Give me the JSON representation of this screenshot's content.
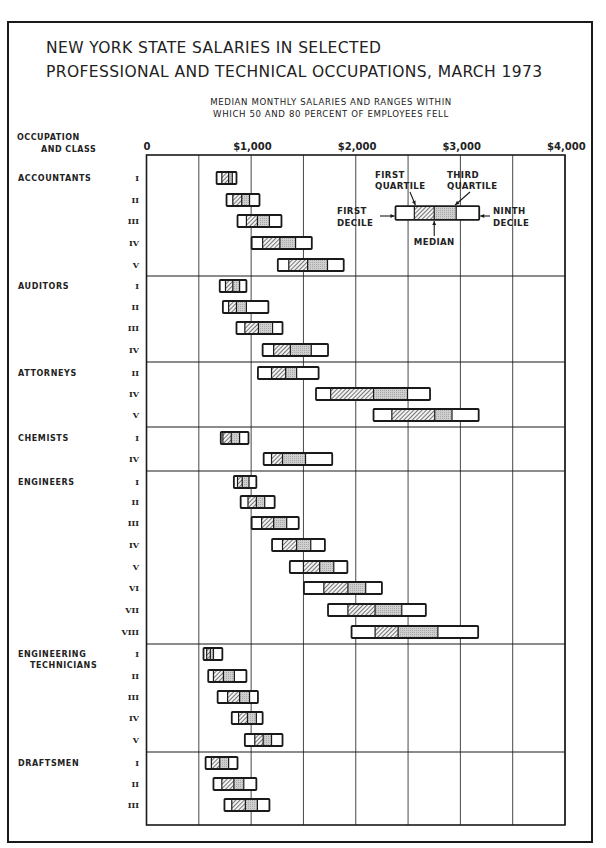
{
  "title": {
    "line1": "NEW YORK STATE SALARIES IN SELECTED",
    "line2": "PROFESSIONAL AND TECHNICAL OCCUPATIONS, MARCH 1973"
  },
  "subtitle": {
    "line1": "MEDIAN MONTHLY SALARIES AND RANGES WITHIN",
    "line2": "WHICH 50 AND 80 PERCENT OF EMPLOYEES FELL"
  },
  "axis_header": {
    "line1": "OCCUPATION",
    "line2": "AND CLASS"
  },
  "legend": {
    "first_quartile": [
      "FIRST",
      "QUARTILE"
    ],
    "third_quartile": [
      "THIRD",
      "QUARTILE"
    ],
    "first_decile": [
      "FIRST",
      "DECILE"
    ],
    "ninth_decile": [
      "NINTH",
      "DECILE"
    ],
    "median": "MEDIAN"
  },
  "chart_data": {
    "type": "box-range",
    "title": "NEW YORK STATE SALARIES IN SELECTED PROFESSIONAL AND TECHNICAL OCCUPATIONS, MARCH 1973",
    "subtitle": "MEDIAN MONTHLY SALARIES AND RANGES WITHIN WHICH 50 AND 80 PERCENT OF EMPLOYEES FELL",
    "xlabel": "Monthly salary ($)",
    "ylabel": "OCCUPATION AND CLASS",
    "xlim": [
      0,
      4000
    ],
    "x_ticks": [
      {
        "value": 0,
        "label": "0"
      },
      {
        "value": 1000,
        "label": "$1,000"
      },
      {
        "value": 2000,
        "label": "$2,000"
      },
      {
        "value": 3000,
        "label": "$3,000"
      },
      {
        "value": 4000,
        "label": "$4,000"
      }
    ],
    "gridlines_every": 500,
    "series_keys": [
      "first_decile",
      "first_quartile",
      "median",
      "third_quartile",
      "ninth_decile"
    ],
    "groups": [
      {
        "occupation": "ACCOUNTANTS",
        "rows": [
          {
            "class": "I",
            "d1": 670,
            "q1": 720,
            "median": 785,
            "q3": 820,
            "d9": 860
          },
          {
            "class": "II",
            "d1": 765,
            "q1": 825,
            "median": 910,
            "q3": 985,
            "d9": 1080
          },
          {
            "class": "III",
            "d1": 870,
            "q1": 955,
            "median": 1060,
            "q3": 1175,
            "d9": 1290
          },
          {
            "class": "IV",
            "d1": 1005,
            "q1": 1110,
            "median": 1275,
            "q3": 1425,
            "d9": 1580
          },
          {
            "class": "V",
            "d1": 1255,
            "q1": 1360,
            "median": 1540,
            "q3": 1730,
            "d9": 1885
          }
        ]
      },
      {
        "occupation": "AUDITORS",
        "rows": [
          {
            "class": "I",
            "d1": 700,
            "q1": 755,
            "median": 825,
            "q3": 890,
            "d9": 955
          },
          {
            "class": "II",
            "d1": 730,
            "q1": 785,
            "median": 860,
            "q3": 955,
            "d9": 1165
          },
          {
            "class": "III",
            "d1": 860,
            "q1": 940,
            "median": 1070,
            "q3": 1205,
            "d9": 1300
          },
          {
            "class": "IV",
            "d1": 1110,
            "q1": 1215,
            "median": 1375,
            "q3": 1575,
            "d9": 1735
          }
        ]
      },
      {
        "occupation": "ATTORNEYS",
        "rows": [
          {
            "class": "II",
            "d1": 1065,
            "q1": 1195,
            "median": 1330,
            "q3": 1435,
            "d9": 1645
          },
          {
            "class": "IV",
            "d1": 1620,
            "q1": 1760,
            "median": 2170,
            "q3": 2495,
            "d9": 2710
          },
          {
            "class": "V",
            "d1": 2170,
            "q1": 2345,
            "median": 2755,
            "q3": 2920,
            "d9": 3175
          }
        ]
      },
      {
        "occupation": "CHEMISTS",
        "rows": [
          {
            "class": "I",
            "d1": 710,
            "q1": 730,
            "median": 810,
            "q3": 890,
            "d9": 975
          },
          {
            "class": "IV",
            "d1": 1120,
            "q1": 1195,
            "median": 1300,
            "q3": 1520,
            "d9": 1775
          }
        ]
      },
      {
        "occupation": "ENGINEERS",
        "rows": [
          {
            "class": "I",
            "d1": 835,
            "q1": 870,
            "median": 915,
            "q3": 980,
            "d9": 1050
          },
          {
            "class": "II",
            "d1": 900,
            "q1": 970,
            "median": 1050,
            "q3": 1130,
            "d9": 1225
          },
          {
            "class": "III",
            "d1": 1005,
            "q1": 1100,
            "median": 1215,
            "q3": 1340,
            "d9": 1455
          },
          {
            "class": "IV",
            "d1": 1200,
            "q1": 1300,
            "median": 1435,
            "q3": 1570,
            "d9": 1705
          },
          {
            "class": "V",
            "d1": 1370,
            "q1": 1500,
            "median": 1655,
            "q3": 1790,
            "d9": 1920
          },
          {
            "class": "VI",
            "d1": 1505,
            "q1": 1695,
            "median": 1925,
            "q3": 2095,
            "d9": 2250
          },
          {
            "class": "VII",
            "d1": 1735,
            "q1": 1925,
            "median": 2185,
            "q3": 2440,
            "d9": 2670
          },
          {
            "class": "VIII",
            "d1": 1960,
            "q1": 2185,
            "median": 2405,
            "q3": 2785,
            "d9": 3170
          }
        ]
      },
      {
        "occupation": "ENGINEERING TECHNICIANS",
        "label_lines": [
          "ENGINEERING",
          "TECHNICIANS"
        ],
        "rows": [
          {
            "class": "I",
            "d1": 545,
            "q1": 575,
            "median": 610,
            "q3": 640,
            "d9": 725
          },
          {
            "class": "II",
            "d1": 590,
            "q1": 640,
            "median": 735,
            "q3": 840,
            "d9": 955
          },
          {
            "class": "III",
            "d1": 680,
            "q1": 775,
            "median": 890,
            "q3": 985,
            "d9": 1065
          },
          {
            "class": "IV",
            "d1": 815,
            "q1": 880,
            "median": 965,
            "q3": 1050,
            "d9": 1110
          },
          {
            "class": "V",
            "d1": 940,
            "q1": 1035,
            "median": 1115,
            "q3": 1195,
            "d9": 1300
          }
        ]
      },
      {
        "occupation": "DRAFTSMEN",
        "rows": [
          {
            "class": "I",
            "d1": 565,
            "q1": 620,
            "median": 700,
            "q3": 785,
            "d9": 870
          },
          {
            "class": "II",
            "d1": 640,
            "q1": 720,
            "median": 835,
            "q3": 930,
            "d9": 1050
          },
          {
            "class": "III",
            "d1": 745,
            "q1": 815,
            "median": 945,
            "q3": 1060,
            "d9": 1175
          }
        ]
      }
    ],
    "legend_example": {
      "d1": 2380,
      "q1": 2560,
      "median": 2750,
      "q3": 2960,
      "d9": 3180
    },
    "colors": {
      "ink": "#1a1a1a",
      "median_to_q3_fill": "#c8c8c8",
      "q1_to_median_fill": "hatched",
      "background": "#ffffff"
    },
    "grid": true,
    "legend_position": "top-right inset"
  }
}
